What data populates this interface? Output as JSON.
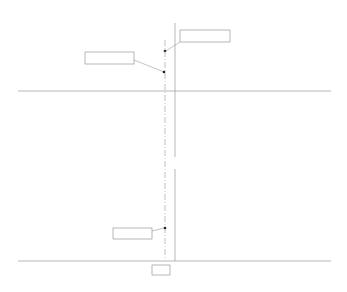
{
  "chart_data": [
    {
      "type": "line",
      "title": "",
      "ylabel": "F [kN/m]",
      "xlabel": "T/Tp",
      "xlim": [
        -1.5,
        1.5
      ],
      "ylim": [
        -1000,
        1000
      ],
      "x_ticks": [
        "-1.5",
        "-1",
        "-0.5",
        "0",
        "0.5",
        "1",
        "1.5"
      ],
      "y_ticks": [
        "1000",
        "500",
        "0",
        "-500",
        "-1000"
      ],
      "series": [
        {
          "name": "Fy (solid)",
          "style": "solid",
          "x": [
            -1.5,
            -1.25,
            -1.0,
            -0.75,
            -0.5,
            -0.25,
            0,
            0.25,
            0.5,
            0.75,
            1.0,
            1.25,
            1.5
          ],
          "values": [
            -200,
            50,
            330,
            80,
            -320,
            -40,
            340,
            50,
            -320,
            -60,
            330,
            40,
            -190
          ]
        },
        {
          "name": "Fx (dashed)",
          "style": "dashed",
          "x": [
            -1.5,
            -1.25,
            -1.0,
            -0.75,
            -0.5,
            -0.25,
            -0.1,
            0,
            0.25,
            0.5,
            0.75,
            1.0,
            1.25,
            1.5
          ],
          "values": [
            0,
            780,
            250,
            -780,
            -200,
            850,
            606,
            150,
            -900,
            -100,
            820,
            100,
            -800,
            0
          ]
        }
      ],
      "annotations": [
        {
          "label": "Fx",
          "text": "= 606 kN/m",
          "x": -0.1,
          "y": 606
        },
        {
          "label": "Fy",
          "text": "= 277 kN/m",
          "x": -0.1,
          "y": 277
        }
      ]
    },
    {
      "type": "line",
      "title": "",
      "ylabel": "Cs",
      "xlabel": "T/Tp",
      "xlim": [
        -1.5,
        1.5
      ],
      "ylim": [
        0,
        3
      ],
      "x_ticks": [
        "-1.5",
        "-1",
        "-0.5",
        "0",
        "0.5",
        "1",
        "1.5"
      ],
      "y_ticks": [
        "3",
        "2",
        "1",
        "0"
      ],
      "segments": [
        {
          "x": [
            -1.08,
            -1.02,
            -0.97
          ],
          "values": [
            2.0,
            1.75,
            2.2
          ]
        },
        {
          "x": [
            -0.5,
            -0.4,
            -0.34,
            -0.31
          ],
          "values": [
            2.5,
            1.9,
            1.8,
            2.2
          ]
        },
        {
          "x": [
            -0.21,
            -0.16,
            -0.1,
            -0.05,
            0,
            0.05
          ],
          "values": [
            1.85,
            1.1,
            1.04,
            1.3,
            1.6,
            2.1
          ]
        },
        {
          "x": [
            0.45,
            0.55,
            0.6,
            0.64,
            0.69
          ],
          "values": [
            2.7,
            2.0,
            1.8,
            1.9,
            3.0
          ]
        },
        {
          "x": [
            0.8,
            0.86,
            0.91,
            0.99
          ],
          "values": [
            2.3,
            1.8,
            1.8,
            2.5
          ]
        }
      ],
      "annotations": [
        {
          "label": "Cmin",
          "text": "= 1.04",
          "x": -0.1,
          "y": 1.04
        },
        {
          "label": "x_marker",
          "text": "-0.10",
          "x": -0.1
        }
      ]
    }
  ],
  "labels": {
    "top_ylabel_var": "F",
    "top_ylabel_unit": "[kN/m]",
    "x_var": "T/T",
    "x_sub": "p",
    "bottom_ylabel_var": "C",
    "bottom_ylabel_sub": "s",
    "fx_var": "F",
    "fx_sub": "x",
    "fx_text": " = 606 kN/m",
    "fy_var": "F",
    "fy_sub": "y",
    "fy_text": " = 277 kN/m",
    "cmin_var": "C",
    "cmin_sub": "min",
    "cmin_text": " = 1.04",
    "marker_text": "-0.10"
  },
  "ticks": {
    "top_x": [
      {
        "t": -1.5,
        "label": "-1.5"
      },
      {
        "t": -1,
        "label": "-1"
      },
      {
        "t": -0.5,
        "label": "-0.5"
      },
      {
        "t": 0,
        "label": "0"
      },
      {
        "t": 0.5,
        "label": "0.5"
      },
      {
        "t": 1,
        "label": "1"
      },
      {
        "t": 1.5,
        "label": "1.5"
      }
    ],
    "top_y": [
      {
        "v": 1000,
        "label": "1000"
      },
      {
        "v": 500,
        "label": "500"
      },
      {
        "v": 0,
        "label": "0"
      },
      {
        "v": -500,
        "label": "-500"
      },
      {
        "v": -1000,
        "label": "-1000"
      }
    ],
    "bottom_y": [
      {
        "v": 3,
        "label": "3"
      },
      {
        "v": 2,
        "label": "2"
      },
      {
        "v": 1,
        "label": "1"
      },
      {
        "v": 0,
        "label": "0"
      }
    ]
  },
  "colors": {
    "line": "#222222",
    "axis": "#888888",
    "marker_line": "#999999"
  }
}
